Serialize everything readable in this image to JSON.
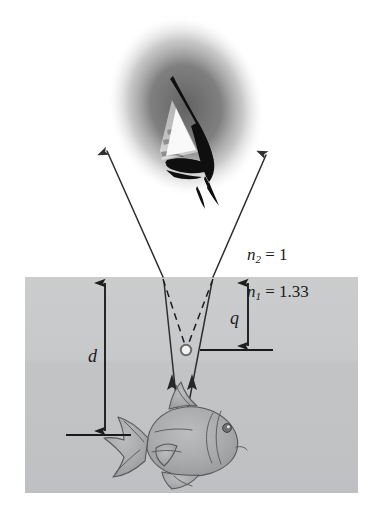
{
  "figure": {
    "type": "optics-ray-diagram",
    "width": 380,
    "height": 520
  },
  "labels": {
    "n2": {
      "symbol": "n",
      "subscript": "2",
      "equals": "=",
      "value": "1",
      "text": "n2 = 1"
    },
    "n1": {
      "symbol": "n",
      "subscript": "1",
      "equals": "=",
      "value": "1.33",
      "text": "n1 = 1.33"
    },
    "d": {
      "text": "d",
      "meaning": "true depth of fish"
    },
    "q": {
      "text": "q",
      "meaning": "apparent depth of image"
    }
  },
  "regions": {
    "air": {
      "name": "air",
      "index": "1",
      "fill": "#ffffff"
    },
    "water": {
      "name": "water",
      "index": "1.33",
      "fill": "#c8c9cb",
      "fill_lower": "#c2c4c6",
      "x": 25,
      "y": 277,
      "width": 333,
      "height": 216
    },
    "surface_y": 277
  },
  "objects": {
    "eye": {
      "name": "observer-eye",
      "center_x": 186,
      "center_y": 105,
      "blur_fill": "#6e6e6e",
      "outline_fill": "#111111"
    },
    "fish": {
      "name": "fish",
      "center_x": 178,
      "center_y": 437,
      "body_fill": "#a8a9ab",
      "outline": "#4a4a4c",
      "facing": "right"
    },
    "image_point": {
      "name": "apparent-image-point",
      "x": 186,
      "y": 350,
      "radius": 5,
      "fill": "#ffffff",
      "stroke": "#6a6a6a"
    },
    "object_point": {
      "name": "object-point-on-fish",
      "x": 181,
      "y": 444
    }
  },
  "rays": {
    "stroke": "#2a2a2a",
    "dash_stroke": "#1a1a1a",
    "left": {
      "name": "left-ray",
      "source_x": 181,
      "source_y": 444,
      "refract_x": 163,
      "refract_y": 277,
      "tip_x": 105,
      "tip_y": 148
    },
    "right": {
      "name": "right-ray",
      "source_x": 181,
      "source_y": 444,
      "refract_x": 213,
      "refract_y": 277,
      "tip_x": 268,
      "tip_y": 152
    },
    "dashed_left": {
      "from_x": 163,
      "from_y": 277,
      "to_x": 186,
      "to_y": 350
    },
    "dashed_right": {
      "from_x": 213,
      "from_y": 277,
      "to_x": 186,
      "to_y": 350
    }
  },
  "measures": {
    "d_arrow": {
      "name": "depth-arrow-d",
      "x": 105,
      "y_top": 281,
      "y_bottom": 433
    },
    "q_arrow": {
      "name": "apparent-depth-arrow-q",
      "x": 248,
      "y_top": 281,
      "y_bottom": 348
    },
    "baseline_fish": {
      "name": "fish-depth-baseline",
      "x1": 66,
      "x2": 131,
      "y": 435
    },
    "baseline_image": {
      "name": "image-depth-baseline",
      "x1": 200,
      "x2": 273,
      "y": 350
    }
  }
}
